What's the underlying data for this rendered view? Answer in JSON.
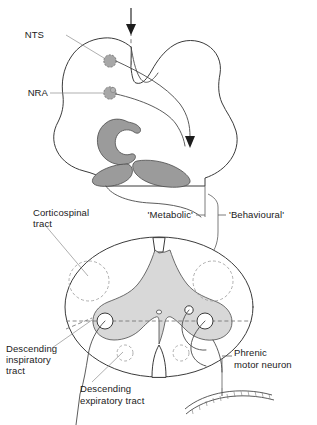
{
  "figure": {
    "background_color": "#ffffff",
    "ink_color": "#1a1a1a",
    "grey_fill": "#9b9b9b",
    "grey_matter_fill": "#d8d8d8",
    "leader_color": "#8d8d8d"
  },
  "labels": {
    "nts": "NTS",
    "nra": "NRA",
    "metabolic": "'Metabolic'",
    "behavioural": "'Behavioural'",
    "corticospinal_tract": "Corticospinal\ntract",
    "corticospinal_tract_line1": "Corticospinal",
    "corticospinal_tract_line2": "tract",
    "descending_inspiratory_line1": "Descending",
    "descending_inspiratory_line2": "inspiratory",
    "descending_inspiratory_line3": "tract",
    "descending_expiratory_line1": "Descending",
    "descending_expiratory_line2": "expiratory tract",
    "phrenic_line1": "Phrenic",
    "phrenic_line2": "motor neuron"
  },
  "structures": {
    "brainstem": "medulla-cross-section",
    "inferior_olive": "c-shaped-nucleus",
    "pyramids": "paired-grey-lobes",
    "spinal_cord": "cervical-cord-cross-section",
    "grey_matter": "butterfly-grey-matter",
    "central_canal": "central-canal",
    "diaphragm": "diaphragm-band"
  },
  "annotations": {
    "afferent_arrow": "descending-input-arrow",
    "efferent_arrow": "descending-output-arrow",
    "midline": "dashed-midline"
  }
}
